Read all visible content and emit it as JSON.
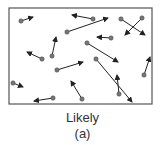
{
  "figure": {
    "caption": "Likely",
    "sublabel": "(a)",
    "colors": {
      "border": "#555555",
      "particle": "#777777",
      "arrow": "#222222"
    },
    "box": {
      "x": 9,
      "y": 8,
      "width": 143,
      "height": 96
    },
    "particles": [
      {
        "x": 21,
        "y": 21,
        "tx": 33,
        "ty": 17
      },
      {
        "x": 93,
        "y": 19,
        "tx": 72,
        "ty": 15
      },
      {
        "x": 67,
        "y": 32,
        "tx": 108,
        "ty": 18
      },
      {
        "x": 121,
        "y": 19,
        "tx": 145,
        "ty": 35
      },
      {
        "x": 142,
        "y": 18,
        "tx": 125,
        "ty": 35
      },
      {
        "x": 111,
        "y": 38,
        "tx": 97,
        "ty": 37
      },
      {
        "x": 52,
        "y": 56,
        "tx": 56,
        "ty": 37
      },
      {
        "x": 42,
        "y": 59,
        "tx": 27,
        "ty": 52
      },
      {
        "x": 87,
        "y": 43,
        "tx": 118,
        "ty": 62
      },
      {
        "x": 96,
        "y": 59,
        "tx": 132,
        "ty": 102
      },
      {
        "x": 57,
        "y": 70,
        "tx": 83,
        "ty": 62
      },
      {
        "x": 144,
        "y": 75,
        "tx": 150,
        "ty": 57
      },
      {
        "x": 13,
        "y": 83,
        "tx": 23,
        "ty": 87
      },
      {
        "x": 82,
        "y": 99,
        "tx": 71,
        "ty": 81
      },
      {
        "x": 119,
        "y": 94,
        "tx": 117,
        "ty": 75
      },
      {
        "x": 53,
        "y": 98,
        "tx": 34,
        "ty": 101
      }
    ]
  }
}
